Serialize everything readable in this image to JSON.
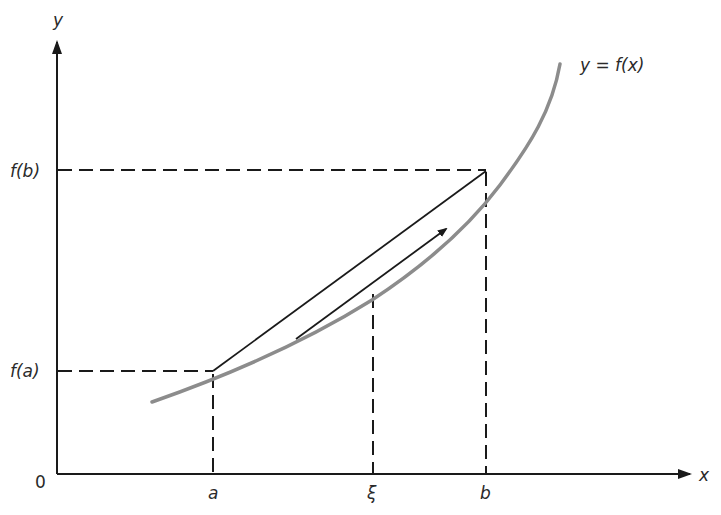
{
  "figure": {
    "type": "mean-value-theorem-diagram",
    "axes": {
      "x_label": "x",
      "y_label": "y",
      "origin_label": "0"
    },
    "curve": {
      "label": "y = f(x)",
      "color": "#8c8c8c"
    },
    "x_markers": [
      {
        "id": "a",
        "label": "a"
      },
      {
        "id": "xi",
        "label": "ξ"
      },
      {
        "id": "b",
        "label": "b"
      }
    ],
    "y_markers": [
      {
        "id": "fa",
        "label": "f(a)"
      },
      {
        "id": "fb",
        "label": "f(b)"
      }
    ],
    "elements": {
      "secant": "chord from (a, f(a)) to (b, f(b))",
      "tangent": "tangent arrow at ξ, parallel to the chord"
    },
    "colors": {
      "axis": "#1a1a1a",
      "curve": "#8c8c8c",
      "dashed": "#1a1a1a"
    }
  }
}
